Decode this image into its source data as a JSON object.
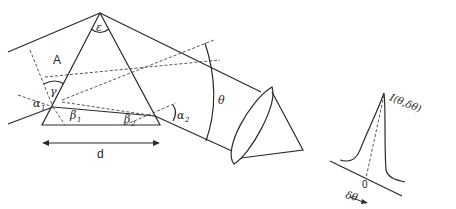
{
  "diagram": {
    "labels": {
      "beam_region": "A",
      "apex_angle": "ε",
      "gamma": "γ",
      "alpha1": "α",
      "alpha1_sub": "1",
      "beta1": "β",
      "beta1_sub": "1",
      "beta2": "β",
      "beta2_sub": "2",
      "alpha2": "α",
      "alpha2_sub": "2",
      "theta": "θ",
      "base_width": "d",
      "intensity": "I(θ,δθ)",
      "origin": "0",
      "delta_theta": "δθ"
    },
    "colors": {
      "line": "#2a2a2a",
      "dashed": "#555555",
      "background": "#ffffff"
    }
  }
}
